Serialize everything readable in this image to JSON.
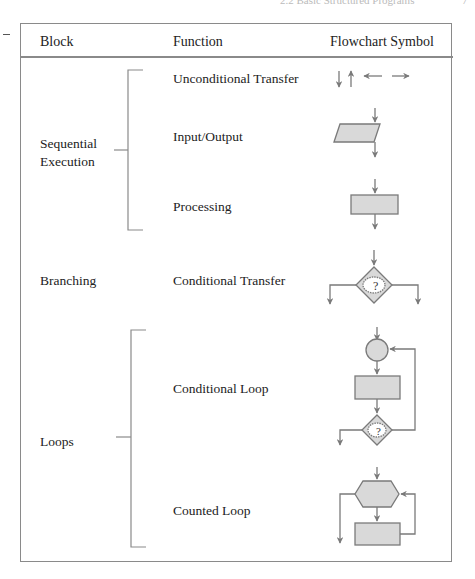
{
  "page": {
    "running_head": "2.2  Basic Structured Programs",
    "page_number": "7"
  },
  "table": {
    "headers": [
      "Block",
      "Function",
      "Flowchart Symbol"
    ],
    "blocks": [
      {
        "label_lines": [
          "Sequential",
          "Execution"
        ],
        "functions": [
          {
            "label": "Unconditional Transfer",
            "symbol": "arrows-icon"
          },
          {
            "label": "Input/Output",
            "symbol": "parallelogram-icon"
          },
          {
            "label": "Processing",
            "symbol": "rectangle-icon"
          }
        ]
      },
      {
        "label_lines": [
          "Branching"
        ],
        "functions": [
          {
            "label": "Conditional Transfer",
            "symbol": "decision-diamond-icon"
          }
        ]
      },
      {
        "label_lines": [
          "Loops"
        ],
        "functions": [
          {
            "label": "Conditional Loop",
            "symbol": "conditional-loop-icon"
          },
          {
            "label": "Counted Loop",
            "symbol": "counted-loop-icon"
          }
        ]
      }
    ],
    "decision_mark": "?"
  },
  "colors": {
    "border": "#8a8a8a",
    "symbol_fill": "#d9d9d9",
    "symbol_stroke": "#7a7a7a",
    "text": "#222222"
  }
}
